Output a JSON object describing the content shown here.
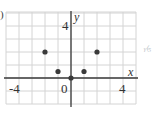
{
  "part_marker": ")",
  "side_note": "y = x",
  "chart_data": {
    "type": "scatter",
    "title": "",
    "xlabel": "x",
    "ylabel": "y",
    "xlim": [
      -5,
      5
    ],
    "ylim": [
      -2,
      5
    ],
    "grid": true,
    "x_tick_labels": [
      "-4",
      "0",
      "4"
    ],
    "y_tick_labels": [
      "4"
    ],
    "points": [
      {
        "x": -2,
        "y": 2
      },
      {
        "x": -1,
        "y": 0.5
      },
      {
        "x": 0,
        "y": 0
      },
      {
        "x": 1,
        "y": 0.5
      },
      {
        "x": 2,
        "y": 2
      }
    ],
    "colors": {
      "grid": "#d4d4d4",
      "axis": "#3a3a3a",
      "point": "#3a3a3a"
    }
  }
}
